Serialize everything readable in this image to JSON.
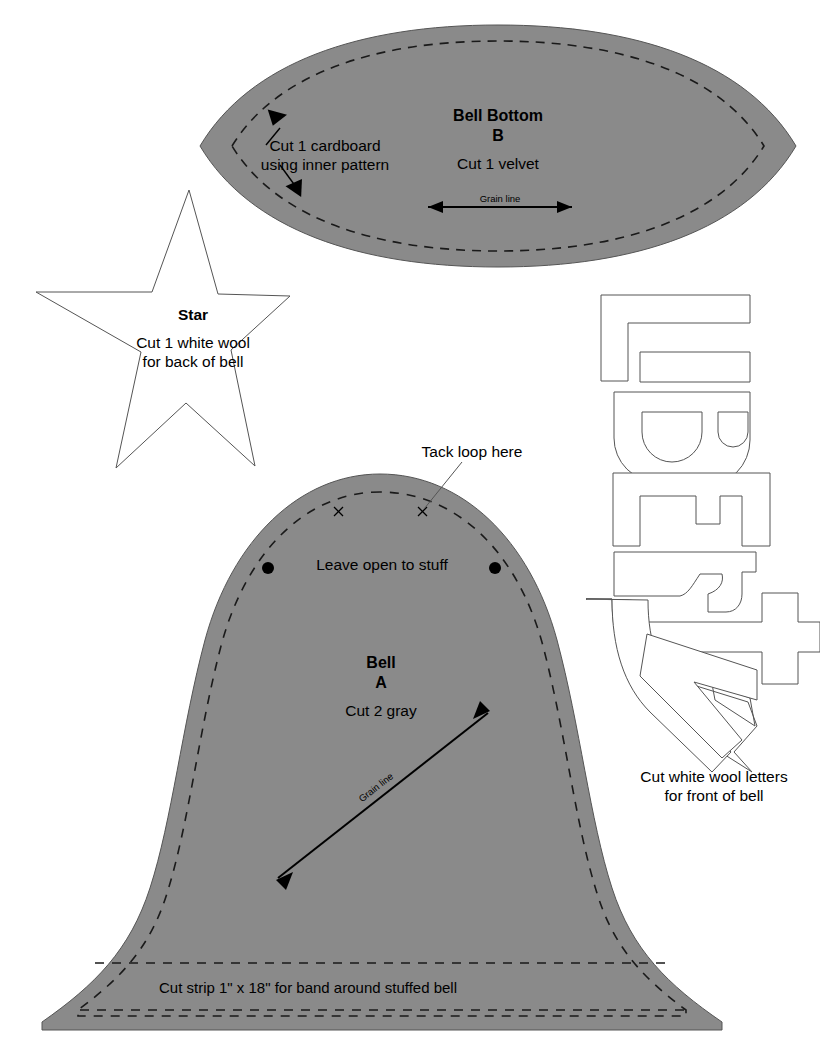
{
  "document": {
    "kind": "sewing-pattern-sheet",
    "title": "Bell Ornament Pattern Sheet",
    "background_color": "#ffffff",
    "piece_fill_color": "#8a8a8a",
    "line_color": "#000000",
    "outline_color": "#555555",
    "text_color": "#000000"
  },
  "pieces": {
    "bell_bottom": {
      "name": "Bell Bottom",
      "letter_label": "B",
      "title": "Bell Bottom",
      "cut_instruction": "Cut 1 velvet",
      "inner_pattern_note_line1": "Cut 1 cardboard",
      "inner_pattern_note_line2": "using inner pattern",
      "grain_line_label": "Grain line",
      "fill": "#8a8a8a",
      "seam_style": "dashed"
    },
    "star": {
      "name": "Star",
      "title": "Star",
      "cut_instruction_line1": "Cut 1 white wool",
      "cut_instruction_line2": "for back of bell",
      "fill": "none",
      "points": 5
    },
    "bell": {
      "name": "Bell",
      "letter_label": "A",
      "title": "Bell",
      "cut_instruction": "Cut 2 gray",
      "grain_line_label": "Grain line",
      "tack_loop_note": "Tack loop here",
      "leave_open_note": "Leave open to stuff",
      "band_strip_note": "Cut strip 1\" x 18\" for band around stuffed bell",
      "fill": "#8a8a8a",
      "seam_style": "dashed",
      "dot_markers": 2,
      "x_markers": 2
    },
    "letters": {
      "name": "Liberty letters",
      "word": "LIBERTY",
      "glyphs": [
        "L",
        "I",
        "B",
        "E",
        "R",
        "T",
        "Y"
      ],
      "cut_instruction_line1": "Cut white wool letters",
      "cut_instruction_line2": "for front of bell",
      "fill": "none",
      "orientation": "rotated 90 degrees clockwise"
    }
  }
}
